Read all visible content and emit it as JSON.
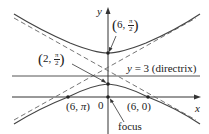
{
  "figure": {
    "type": "hyperbola-polar-conic",
    "axes": {
      "x_label": "x",
      "y_label": "y",
      "origin_label": "0"
    },
    "points": [
      {
        "id": "upper-vertex",
        "label": "(6, π/2)",
        "r": "6",
        "theta_num": "π",
        "theta_den": "2"
      },
      {
        "id": "lower-vertex",
        "label": "(2, π/2)",
        "r": "2",
        "theta_num": "π",
        "theta_den": "2"
      },
      {
        "id": "left-point",
        "label": "(6, π)",
        "r": "6",
        "theta": "π"
      },
      {
        "id": "right-point",
        "label": "(6, 0)",
        "r": "6",
        "theta": "0"
      },
      {
        "id": "focus",
        "label": "focus"
      }
    ],
    "directrix": {
      "label": "y = 3 (directrix)",
      "eq_lhs": "y",
      "eq_rest": " = 3 (directrix)"
    },
    "colors": {
      "curve": "#444444",
      "asymptote": "#666666",
      "axis": "#333333",
      "text": "#222222"
    }
  }
}
